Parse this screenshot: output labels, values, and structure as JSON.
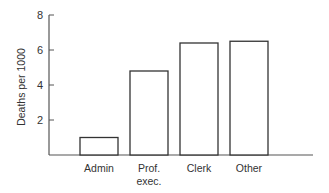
{
  "chart_data": {
    "type": "bar",
    "title": "",
    "xlabel": "",
    "ylabel": "Deaths per 1000",
    "categories": [
      "Admin",
      "Prof. exec.",
      "Clerk",
      "Other"
    ],
    "category_lines": [
      [
        "Admin"
      ],
      [
        "Prof.",
        "exec."
      ],
      [
        "Clerk"
      ],
      [
        "Other"
      ]
    ],
    "values": [
      1.0,
      4.8,
      6.4,
      6.5
    ],
    "ylim": [
      0,
      8
    ],
    "yticks": [
      2,
      4,
      6,
      8
    ],
    "grid": false,
    "legend": null,
    "bar_fill": "#ffffff",
    "bar_stroke": "#333333",
    "axis_color": "#555555"
  }
}
